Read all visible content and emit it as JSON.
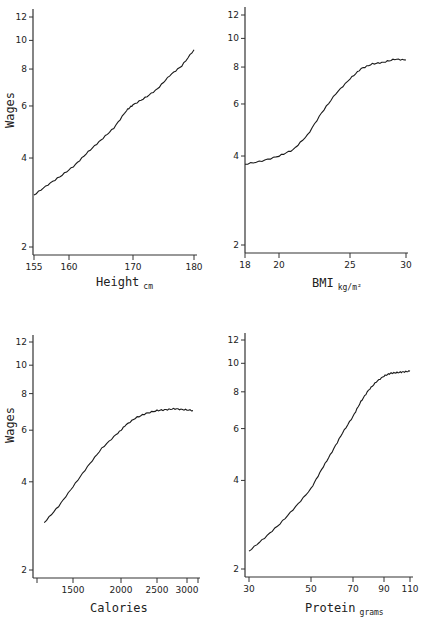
{
  "figure": {
    "panels": [
      {
        "id": "height",
        "xlabel": "Height",
        "xlabel_sub": "cm",
        "ylabel": "Wages"
      },
      {
        "id": "bmi",
        "xlabel": "BMI",
        "xlabel_sub": "kg/m²",
        "ylabel": ""
      },
      {
        "id": "calories",
        "xlabel": "Calories",
        "xlabel_sub": "",
        "ylabel": "Wages"
      },
      {
        "id": "protein",
        "xlabel": "Protein",
        "xlabel_sub": "grams",
        "ylabel": ""
      }
    ],
    "y_tick_labels": [
      "12",
      "10",
      "8",
      "6",
      "4",
      "2"
    ]
  },
  "chart_data": [
    {
      "type": "line",
      "title": "",
      "xlabel": "Height (cm)",
      "ylabel": "Wages",
      "y_scale": "log",
      "ylim": [
        1.9,
        13
      ],
      "y_ticks": [
        2,
        4,
        6,
        8,
        10,
        12
      ],
      "x_ticks": [
        155,
        160,
        170,
        180
      ],
      "xlim": [
        155,
        180
      ],
      "grid": false,
      "series": [
        {
          "name": "Wages vs Height",
          "x": [
            155,
            157,
            159,
            161,
            163,
            165,
            167,
            169,
            170,
            172,
            174,
            176,
            178,
            180
          ],
          "y": [
            3.0,
            3.25,
            3.5,
            3.8,
            4.2,
            4.6,
            5.05,
            5.8,
            6.05,
            6.4,
            6.85,
            7.6,
            8.2,
            9.3
          ]
        }
      ]
    },
    {
      "type": "line",
      "title": "",
      "xlabel": "BMI (kg/m²)",
      "ylabel": "Wages",
      "y_scale": "log",
      "ylim": [
        1.9,
        13
      ],
      "y_ticks": [
        2,
        4,
        6,
        8,
        10,
        12
      ],
      "x_ticks": [
        18,
        20,
        25,
        30
      ],
      "xlim": [
        18,
        30
      ],
      "grid": false,
      "series": [
        {
          "name": "Wages vs BMI",
          "x": [
            18,
            19,
            20,
            21,
            22,
            23,
            24,
            25,
            26,
            27,
            28,
            29,
            30
          ],
          "y": [
            3.75,
            3.85,
            4.0,
            4.2,
            4.7,
            5.6,
            6.5,
            7.3,
            7.9,
            8.2,
            8.3,
            8.5,
            8.45
          ]
        }
      ]
    },
    {
      "type": "line",
      "title": "",
      "xlabel": "Calories",
      "ylabel": "Wages",
      "y_scale": "log",
      "ylim": [
        1.9,
        13
      ],
      "y_ticks": [
        2,
        4,
        6,
        8,
        10,
        12
      ],
      "x_ticks": [
        1500,
        2000,
        2500,
        3000
      ],
      "xlim": [
        1150,
        3200
      ],
      "grid": false,
      "series": [
        {
          "name": "Wages vs Calories",
          "x": [
            1200,
            1350,
            1500,
            1650,
            1800,
            1950,
            2050,
            2200,
            2350,
            2500,
            2650,
            2800,
            2950,
            3100
          ],
          "y": [
            2.9,
            3.3,
            3.85,
            4.5,
            5.2,
            5.8,
            6.2,
            6.6,
            6.85,
            7.0,
            7.05,
            7.1,
            7.05,
            7.0
          ]
        }
      ]
    },
    {
      "type": "line",
      "title": "",
      "xlabel": "Protein (grams)",
      "ylabel": "Wages",
      "y_scale": "log",
      "ylim": [
        1.9,
        13
      ],
      "y_ticks": [
        2,
        4,
        6,
        8,
        10,
        12
      ],
      "x_ticks": [
        30,
        50,
        70,
        90,
        110
      ],
      "xlim": [
        29,
        111
      ],
      "grid": false,
      "series": [
        {
          "name": "Wages vs Protein",
          "x": [
            30,
            35,
            40,
            45,
            50,
            55,
            60,
            65,
            70,
            75,
            80,
            85,
            90,
            95,
            100,
            105,
            110
          ],
          "y": [
            2.3,
            2.55,
            2.85,
            3.25,
            3.75,
            4.35,
            5.0,
            5.8,
            6.6,
            7.4,
            8.1,
            8.65,
            9.05,
            9.25,
            9.3,
            9.35,
            9.4
          ]
        }
      ]
    }
  ]
}
